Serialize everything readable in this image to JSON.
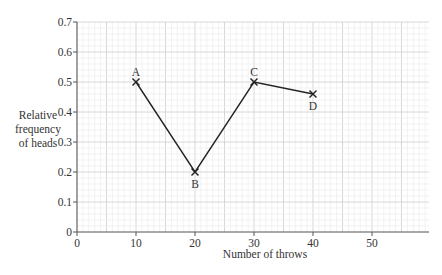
{
  "chart_data": {
    "type": "line",
    "title": "",
    "xlabel": "Number of throws",
    "ylabel": "Relative frequency of heads",
    "ylabel_lines": [
      "Relative",
      "frequency",
      "of heads"
    ],
    "xlim": [
      0,
      60
    ],
    "ylim": [
      0,
      0.7
    ],
    "x_ticks": [
      0,
      10,
      20,
      30,
      40,
      50
    ],
    "y_ticks": [
      0,
      0.1,
      0.2,
      0.3,
      0.4,
      0.5,
      0.6,
      0.7
    ],
    "x_tick_labels": [
      "0",
      "10",
      "20",
      "30",
      "40",
      "50"
    ],
    "y_tick_labels": [
      "0",
      "0.1",
      "0.2",
      "0.3",
      "0.4",
      "0.5",
      "0.6",
      "0.7"
    ],
    "grid": true,
    "legend": null,
    "series": [
      {
        "name": "Relative frequency of heads",
        "marker": "x",
        "color": "#222222",
        "points": [
          {
            "label": "A",
            "x": 10,
            "y": 0.5
          },
          {
            "label": "B",
            "x": 20,
            "y": 0.2
          },
          {
            "label": "C",
            "x": 30,
            "y": 0.5
          },
          {
            "label": "D",
            "x": 40,
            "y": 0.46
          }
        ]
      }
    ]
  },
  "colors": {
    "grid_minor": "#ececec",
    "grid_major": "#d4d4d4",
    "axis": "#555555",
    "line": "#222222"
  }
}
